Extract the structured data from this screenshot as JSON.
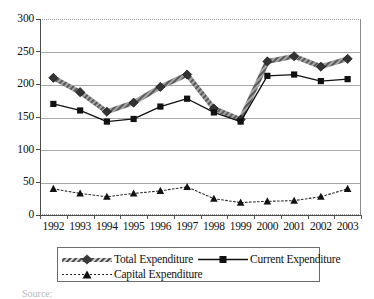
{
  "chart_data": {
    "type": "line",
    "title": "",
    "xlabel": "",
    "ylabel": "",
    "ylim": [
      0,
      300
    ],
    "ytick_values": [
      300,
      250,
      200,
      150,
      100,
      50,
      0
    ],
    "ytick_labels": [
      "300",
      "250",
      "200",
      "150",
      "100",
      "50",
      "0"
    ],
    "grid": true,
    "legend_position": "bottom",
    "categories": [
      "1992",
      "1993",
      "1994",
      "1995",
      "1996",
      "1997",
      "1998",
      "1999",
      "2000",
      "2001",
      "2002",
      "2003"
    ],
    "series": [
      {
        "name": "Total Expenditure",
        "marker": "diamond",
        "line_style": "thick-hatched",
        "color": "#555555",
        "values": [
          210,
          188,
          158,
          172,
          196,
          215,
          163,
          146,
          235,
          243,
          227,
          239
        ]
      },
      {
        "name": "Current Expenditure",
        "marker": "square",
        "line_style": "solid",
        "color": "#111111",
        "values": [
          170,
          160,
          143,
          147,
          166,
          178,
          157,
          143,
          213,
          215,
          205,
          208
        ]
      },
      {
        "name": "Capital Expenditure",
        "marker": "triangle",
        "line_style": "dotted",
        "color": "#222222",
        "values": [
          40,
          33,
          28,
          33,
          37,
          43,
          25,
          19,
          21,
          22,
          28,
          40
        ]
      }
    ]
  },
  "legend": {
    "entries": [
      {
        "label": "Total Expenditure"
      },
      {
        "label": "Current Expenditure"
      },
      {
        "label": "Capital Expenditure"
      }
    ]
  },
  "caption": {
    "source_text": "Source:"
  }
}
